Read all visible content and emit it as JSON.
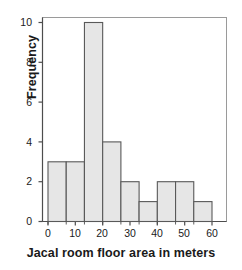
{
  "chart_data": {
    "type": "bar",
    "title": "",
    "subtitle": "",
    "xlabel": "Jacal room floor area in meters",
    "ylabel": "Frequency",
    "xlim": [
      0,
      60
    ],
    "ylim": [
      0,
      10
    ],
    "grid": false,
    "legend": null,
    "bin_width": 6.6667,
    "bin_edges": [
      0,
      6.67,
      13.33,
      20,
      26.67,
      33.33,
      40,
      46.67,
      53.33,
      60
    ],
    "categories": [
      "0–6.7",
      "6.7–13.3",
      "13.3–20",
      "20–26.7",
      "26.7–33.3",
      "33.3–40",
      "40–46.7",
      "46.7–53.3",
      "53.3–60"
    ],
    "values": [
      3,
      3,
      10,
      4,
      2,
      1,
      2,
      2,
      1
    ],
    "xticks": [
      0,
      10,
      20,
      30,
      40,
      50,
      60
    ],
    "xtick_labels": [
      "0",
      "10",
      "20",
      "30",
      "40",
      "50",
      "60"
    ],
    "yticks": [
      0,
      2,
      4,
      6,
      8,
      10
    ],
    "ytick_labels": [
      "0",
      "2",
      "4",
      "6",
      "8",
      "10"
    ],
    "bar_fill_color": "#e6e6e6",
    "bar_edge_color": "#595959",
    "axis_color": "#808080",
    "text_color": "#1a1a1a"
  }
}
